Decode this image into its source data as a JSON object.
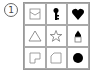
{
  "puzzle": {
    "number": "1",
    "cells": [
      {
        "shape": "envelope-outline",
        "filled": false
      },
      {
        "shape": "key",
        "filled": true
      },
      {
        "shape": "heart",
        "filled": true
      },
      {
        "shape": "triangle-outline",
        "filled": false
      },
      {
        "shape": "star-outline",
        "filled": false
      },
      {
        "shape": "pencil-tip",
        "filled": true
      },
      {
        "shape": "notched-square-outline",
        "filled": false
      },
      {
        "shape": "cut-corner-square-outline",
        "filled": false
      },
      {
        "shape": "circle",
        "filled": true
      }
    ],
    "colors": {
      "stroke": "#777777",
      "fill": "#000000",
      "grid": "#aaaaaa"
    }
  }
}
